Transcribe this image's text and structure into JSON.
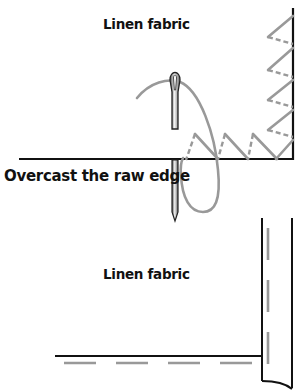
{
  "diagram": {
    "top_panel": {
      "fabric_label": "Linen fabric",
      "instruction_label": "Overcast the raw edge"
    },
    "bottom_panel": {
      "fabric_label": "Linen fabric"
    },
    "colors": {
      "fabric_edge": "#111111",
      "thread": "#9a9a9a",
      "needle": "#555555",
      "background": "#ffffff"
    }
  }
}
